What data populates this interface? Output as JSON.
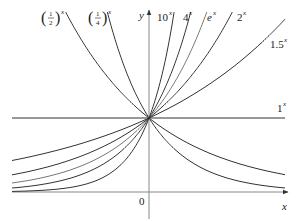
{
  "chart_data": {
    "type": "line",
    "title": "",
    "xlabel": "x",
    "ylabel": "y",
    "origin_label": "0",
    "xlim": [
      -2.1,
      2.1
    ],
    "ylim": [
      -0.4,
      2.43
    ],
    "grid": false,
    "legend": "inline labels at curve ends",
    "series": [
      {
        "name": "(1/2)^x",
        "base": 0.5,
        "label_num": "1",
        "label_den": "2",
        "label_type": "fraction"
      },
      {
        "name": "(1/4)^x",
        "base": 0.25,
        "label_num": "1",
        "label_den": "4",
        "label_type": "fraction"
      },
      {
        "name": "10^x",
        "base": 10,
        "label": "10",
        "label_type": "power"
      },
      {
        "name": "4^x",
        "base": 4,
        "label": "4",
        "label_type": "power"
      },
      {
        "name": "e^x",
        "base": 2.718281828,
        "label": "e",
        "label_type": "power"
      },
      {
        "name": "2^x",
        "base": 2,
        "label": "2",
        "label_type": "power"
      },
      {
        "name": "1.5^x",
        "base": 1.5,
        "label": "1.5",
        "label_type": "power"
      },
      {
        "name": "1^x",
        "base": 1,
        "label": "1",
        "label_type": "power"
      }
    ],
    "annotations": [
      "All curves pass through (0, 1)"
    ]
  },
  "labels": {
    "exponent": "x",
    "half_num": "1",
    "half_den": "2",
    "quarter_num": "1",
    "quarter_den": "4",
    "ten": "10",
    "four": "4",
    "e": "e",
    "two": "2",
    "onefive": "1.5",
    "one": "1",
    "x_axis": "x",
    "y_axis": "y",
    "origin": "0"
  }
}
